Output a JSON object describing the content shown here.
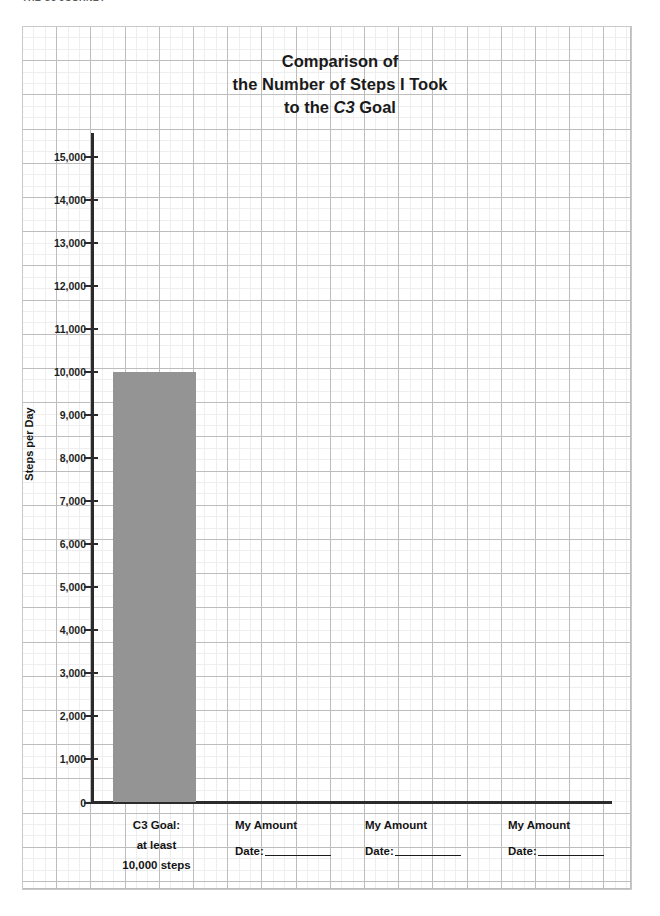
{
  "page": {
    "cut_off_header": "THE C3 JOURNEY"
  },
  "chart_title": {
    "line1": "Comparison of",
    "line2_a": "the ",
    "line2_b": "Number of Steps",
    "line2_c": " I Took",
    "line3_a": "to the ",
    "line3_b": "C3",
    "line3_c": " Goal"
  },
  "axes": {
    "y_title": "Steps per Day",
    "y_ticks": [
      "15,000",
      "14,000",
      "13,000",
      "12,000",
      "11,000",
      "10,000",
      "9,000",
      "8,000",
      "7,000",
      "6,000",
      "5,000",
      "4,000",
      "3,000",
      "2,000",
      "1,000",
      "0"
    ]
  },
  "categories": [
    {
      "label_line1": "C3 Goal:",
      "label_line2": "at least",
      "label_line3": "10,000 steps",
      "has_date": false
    },
    {
      "label_line1": "My Amount",
      "date_label": "Date:",
      "has_date": true
    },
    {
      "label_line1": "My Amount",
      "date_label": "Date:",
      "has_date": true
    },
    {
      "label_line1": "My Amount",
      "date_label": "Date:",
      "has_date": true
    }
  ],
  "colors": {
    "bar_fill": "#949494",
    "axis": "#2b2b2b",
    "grid_major": "#bdbdbd",
    "grid_minor": "#eeeeee",
    "text": "#141414"
  },
  "chart_data": {
    "type": "bar",
    "title": "Comparison of the Number of Steps I Took to the C3 Goal",
    "xlabel": "",
    "ylabel": "Steps per Day",
    "ylim": [
      0,
      15000
    ],
    "ytick_step": 1000,
    "grid": true,
    "legend": "none",
    "categories": [
      "C3 Goal: at least 10,000 steps",
      "My Amount Date:",
      "My Amount Date:",
      "My Amount Date:"
    ],
    "values": [
      10000,
      null,
      null,
      null
    ],
    "bar_color": "#949494"
  }
}
